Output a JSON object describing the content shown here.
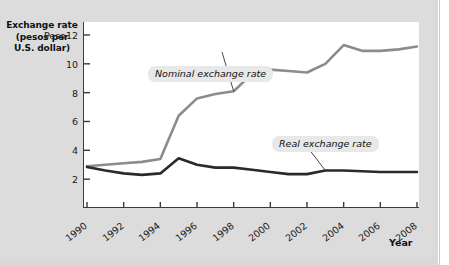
{
  "figure": {
    "background_color": "#dcdcdc",
    "plot_background_color": "#ffffff"
  },
  "axis_title": {
    "line1": "Exchange rate",
    "line2": "(pesos per",
    "line3": "U.S. dollar)"
  },
  "x_axis_caption": "Year",
  "annotations": {
    "nominal": "Nominal exchange rate",
    "real": "Real exchange rate"
  },
  "chart_data": {
    "type": "line",
    "title": "",
    "subtitle": "",
    "xlabel": "Year",
    "ylabel": "Exchange rate (pesos per U.S. dollar)",
    "xlim": [
      1990,
      2008
    ],
    "ylim": [
      0,
      12.9
    ],
    "grid": false,
    "legend_position": "inline-annotations",
    "y_ticks": [
      2,
      4,
      6,
      8,
      10,
      12
    ],
    "y_tick_labels": [
      "2",
      "4",
      "6",
      "8",
      "10",
      "Peso12"
    ],
    "x_ticks": [
      1990,
      1992,
      1994,
      1996,
      1998,
      2000,
      2002,
      2004,
      2006,
      2008
    ],
    "x_tick_labels": [
      "1990",
      "1992",
      "1994",
      "1996",
      "1998",
      "2000",
      "2002",
      "2004",
      "2006",
      "2008"
    ],
    "x": [
      1990,
      1991,
      1992,
      1993,
      1994,
      1995,
      1996,
      1997,
      1998,
      1999,
      2000,
      2001,
      2002,
      2003,
      2004,
      2005,
      2006,
      2007,
      2008
    ],
    "series": [
      {
        "name": "Nominal exchange rate",
        "color": "#8c8c8c",
        "line_width": 2.6,
        "values": [
          2.9,
          3.0,
          3.1,
          3.2,
          3.4,
          6.4,
          7.6,
          7.9,
          8.1,
          9.3,
          9.6,
          9.5,
          9.4,
          10.0,
          11.3,
          10.9,
          10.9,
          11.0,
          11.2
        ]
      },
      {
        "name": "Real exchange rate",
        "color": "#2a2a2a",
        "line_width": 2.6,
        "values": [
          2.85,
          2.6,
          2.4,
          2.3,
          2.4,
          3.45,
          3.0,
          2.8,
          2.8,
          2.65,
          2.5,
          2.35,
          2.35,
          2.6,
          2.6,
          2.55,
          2.5,
          2.5,
          2.5
        ]
      }
    ],
    "annotations": [
      {
        "text": "Nominal exchange rate",
        "points_to_series": "Nominal exchange rate",
        "points_to_x": 1998
      },
      {
        "text": "Real exchange rate",
        "points_to_series": "Real exchange rate",
        "points_to_x": 2003
      }
    ]
  }
}
